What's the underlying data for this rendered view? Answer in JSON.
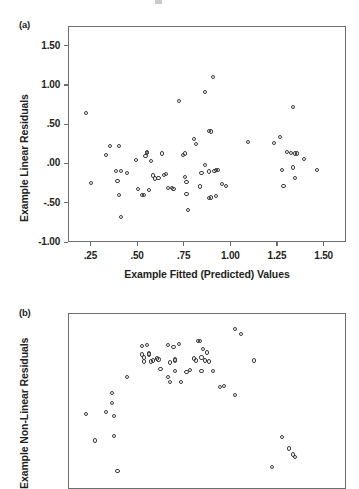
{
  "figure": {
    "title": "",
    "panels": [
      {
        "tag": "(a)",
        "ylabel": "Example Linear Residuals",
        "xlabel": "Example Fitted (Predicted) Values",
        "yticks": [
          "1.50",
          "1.00",
          ".50",
          ".00",
          "-.50",
          "-1.00"
        ],
        "xticks": [
          ".25",
          ".50",
          ".75",
          "1.00",
          "1.25",
          "1.50"
        ]
      },
      {
        "tag": "(b)",
        "ylabel": "Example Non-Linear Residuals",
        "xlabel": "",
        "yticks": [
          "1.00",
          ".50",
          ".00",
          "-.50"
        ],
        "xticks": []
      }
    ]
  },
  "colors": {
    "marker_stroke": "#3b3b3d",
    "axis": "#6d6e71",
    "text": "#231f20",
    "background": "#ffffff"
  },
  "chart_data": [
    {
      "type": "scatter",
      "panel": "(a)",
      "title": "",
      "xlabel": "Example Fitted (Predicted) Values",
      "ylabel": "Example Linear Residuals",
      "xlim": [
        0.13,
        1.62
      ],
      "ylim": [
        -1.0,
        1.75
      ],
      "xticks": [
        0.25,
        0.5,
        0.75,
        1.0,
        1.25,
        1.5
      ],
      "yticks": [
        -1.0,
        -0.5,
        0.0,
        0.5,
        1.0,
        1.5
      ],
      "xtick_labels": [
        ".25",
        ".50",
        ".75",
        "1.00",
        "1.25",
        "1.50"
      ],
      "ytick_labels": [
        "-1.00",
        "-.50",
        ".00",
        ".50",
        "1.00",
        "1.50"
      ],
      "grid": false,
      "legend": false,
      "marker": "open-circle",
      "points": [
        [
          0.22,
          0.66
        ],
        [
          0.25,
          -0.24
        ],
        [
          0.33,
          0.12
        ],
        [
          0.35,
          0.24
        ],
        [
          0.4,
          0.24
        ],
        [
          0.38,
          -0.08
        ],
        [
          0.41,
          -0.08
        ],
        [
          0.39,
          -0.21
        ],
        [
          0.4,
          -0.39
        ],
        [
          0.41,
          -0.67
        ],
        [
          0.44,
          -0.11
        ],
        [
          0.49,
          0.06
        ],
        [
          0.5,
          -0.31
        ],
        [
          0.52,
          -0.39
        ],
        [
          0.53,
          -0.39
        ],
        [
          0.54,
          0.11
        ],
        [
          0.55,
          0.16
        ],
        [
          0.55,
          0.15
        ],
        [
          0.56,
          -0.33
        ],
        [
          0.57,
          0.04
        ],
        [
          0.58,
          -0.14
        ],
        [
          0.59,
          -0.18
        ],
        [
          0.61,
          -0.17
        ],
        [
          0.63,
          0.14
        ],
        [
          0.64,
          -0.13
        ],
        [
          0.65,
          -0.12
        ],
        [
          0.66,
          -0.3
        ],
        [
          0.68,
          -0.3
        ],
        [
          0.69,
          -0.31
        ],
        [
          0.72,
          0.81
        ],
        [
          0.74,
          0.12
        ],
        [
          0.75,
          0.14
        ],
        [
          0.75,
          -0.16
        ],
        [
          0.76,
          -0.22
        ],
        [
          0.76,
          -0.38
        ],
        [
          0.77,
          -0.58
        ],
        [
          0.8,
          0.32
        ],
        [
          0.81,
          0.26
        ],
        [
          0.84,
          -0.11
        ],
        [
          0.83,
          -0.28
        ],
        [
          0.86,
          0.92
        ],
        [
          0.86,
          -0.01
        ],
        [
          0.88,
          0.43
        ],
        [
          0.89,
          0.42
        ],
        [
          0.88,
          -0.09
        ],
        [
          0.88,
          -0.43
        ],
        [
          0.89,
          -0.42
        ],
        [
          0.9,
          1.11
        ],
        [
          0.91,
          -0.08
        ],
        [
          0.92,
          -0.07
        ],
        [
          0.93,
          -0.07
        ],
        [
          0.92,
          -0.4
        ],
        [
          0.95,
          -0.25
        ],
        [
          0.97,
          -0.27
        ],
        [
          1.09,
          0.29
        ],
        [
          1.23,
          0.27
        ],
        [
          1.26,
          0.35
        ],
        [
          1.27,
          -0.07
        ],
        [
          1.28,
          -0.27
        ],
        [
          1.3,
          0.16
        ],
        [
          1.32,
          0.15
        ],
        [
          1.34,
          0.14
        ],
        [
          1.35,
          0.14
        ],
        [
          1.33,
          -0.04
        ],
        [
          1.34,
          -0.17
        ],
        [
          1.33,
          0.73
        ],
        [
          1.39,
          0.07
        ],
        [
          1.46,
          -0.07
        ]
      ]
    },
    {
      "type": "scatter",
      "panel": "(b)",
      "title": "",
      "xlabel": "",
      "ylabel": "Example Non-Linear Residuals",
      "xlim": [
        0.13,
        1.62
      ],
      "ylim": [
        -0.62,
        1.12
      ],
      "yticks": [
        -0.5,
        0.0,
        0.5,
        1.0
      ],
      "ytick_labels": [
        "-.50",
        ".00",
        ".50",
        "1.00"
      ],
      "grid": false,
      "legend": false,
      "marker": "open-circle",
      "points": [
        [
          0.22,
          0.13
        ],
        [
          0.27,
          -0.13
        ],
        [
          0.33,
          0.15
        ],
        [
          0.36,
          0.34
        ],
        [
          0.36,
          0.24
        ],
        [
          0.37,
          0.11
        ],
        [
          0.37,
          -0.09
        ],
        [
          0.39,
          -0.43
        ],
        [
          0.44,
          0.5
        ],
        [
          0.52,
          0.8
        ],
        [
          0.52,
          0.72
        ],
        [
          0.53,
          0.69
        ],
        [
          0.53,
          0.65
        ],
        [
          0.55,
          0.81
        ],
        [
          0.56,
          0.73
        ],
        [
          0.56,
          0.72
        ],
        [
          0.57,
          0.65
        ],
        [
          0.58,
          0.66
        ],
        [
          0.6,
          0.68
        ],
        [
          0.61,
          0.67
        ],
        [
          0.62,
          0.58
        ],
        [
          0.66,
          0.81
        ],
        [
          0.67,
          0.64
        ],
        [
          0.66,
          0.5
        ],
        [
          0.67,
          0.45
        ],
        [
          0.69,
          0.79
        ],
        [
          0.7,
          0.66
        ],
        [
          0.7,
          0.67
        ],
        [
          0.7,
          0.56
        ],
        [
          0.72,
          0.82
        ],
        [
          0.73,
          0.45
        ],
        [
          0.76,
          0.55
        ],
        [
          0.78,
          0.57
        ],
        [
          0.8,
          0.68
        ],
        [
          0.81,
          0.66
        ],
        [
          0.82,
          0.85
        ],
        [
          0.83,
          0.85
        ],
        [
          0.84,
          0.69
        ],
        [
          0.85,
          0.77
        ],
        [
          0.84,
          0.56
        ],
        [
          0.86,
          0.66
        ],
        [
          0.87,
          0.74
        ],
        [
          0.88,
          0.65
        ],
        [
          0.9,
          0.56
        ],
        [
          0.94,
          0.4
        ],
        [
          0.96,
          0.41
        ],
        [
          1.02,
          0.97
        ],
        [
          1.05,
          0.92
        ],
        [
          1.02,
          0.32
        ],
        [
          1.12,
          0.66
        ],
        [
          1.27,
          -0.1
        ],
        [
          1.31,
          -0.21
        ],
        [
          1.33,
          -0.27
        ],
        [
          1.34,
          -0.29
        ],
        [
          1.22,
          -0.39
        ]
      ]
    }
  ]
}
